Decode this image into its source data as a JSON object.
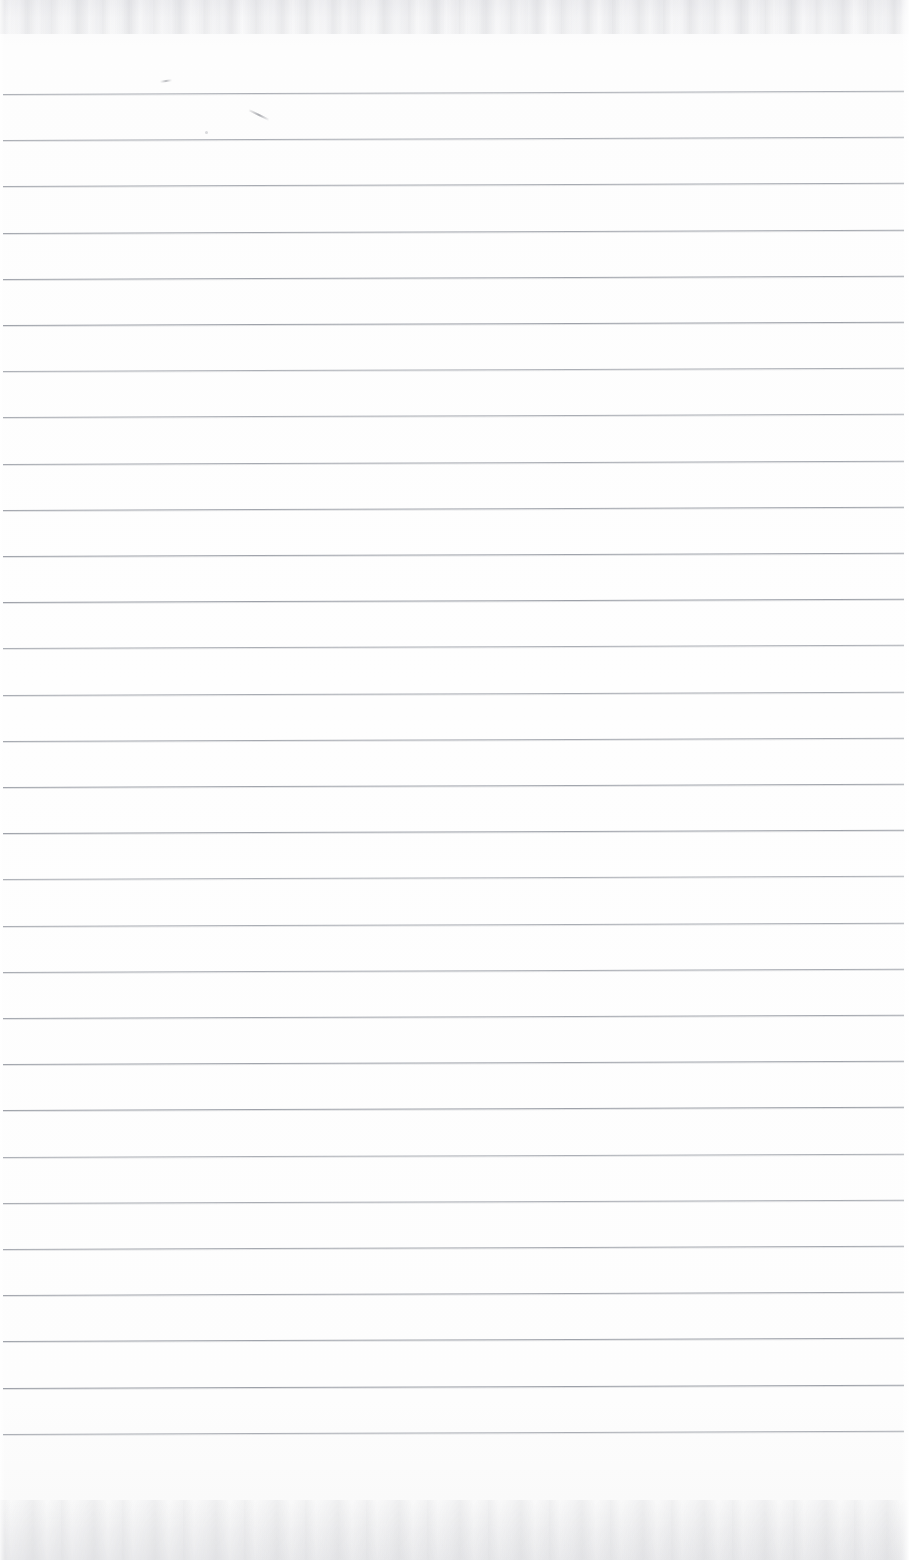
{
  "document": {
    "kind": "scanned-ruled-paper",
    "title": "Blank ruled notebook page",
    "visible_text": "",
    "page_width_px": 909,
    "page_height_px": 1560,
    "orientation": "portrait"
  },
  "colors": {
    "paper": "#fdfdfd",
    "paper_edge": "#f3f3f5",
    "rule_line": "#9a9ea6",
    "pencil_mark": "#86888f",
    "scan_grain": "#aaacb2"
  },
  "ruling": {
    "style": "horizontal ruled lines, no vertical margin rule",
    "line_count": 30,
    "first_line_y": 94,
    "line_spacing_px": 46.2,
    "line_thickness_px": 1,
    "line_start_x": 3,
    "line_end_x": 904,
    "slope_note": "lines rise ~4px from left edge to right edge",
    "line_y_positions": [
      94,
      140.2,
      186.4,
      232.6,
      278.8,
      325.0,
      371.2,
      417.4,
      463.6,
      509.8,
      556.0,
      602.2,
      648.4,
      694.6,
      740.8,
      787.0,
      833.2,
      879.4,
      925.6,
      971.8,
      1018.0,
      1064.2,
      1110.4,
      1156.6,
      1202.8,
      1249.0,
      1295.2,
      1341.4,
      1387.6,
      1433.8
    ]
  },
  "margins": {
    "top_unruled_px": 94,
    "bottom_unruled_px": 102,
    "left_px": 3,
    "right_px": 5
  },
  "annotations": {
    "pencil_marks": [
      {
        "name": "pencil-tick-mark",
        "x": 160,
        "y": 80,
        "description": "very faint short pencil tick above first rule"
      },
      {
        "name": "pencil-diagonal-stroke",
        "x": 248,
        "y": 114,
        "description": "faint short diagonal pencil stroke between rules 1 and 2"
      },
      {
        "name": "pencil-speck",
        "x": 205,
        "y": 131,
        "description": "tiny graphite speck"
      }
    ]
  }
}
